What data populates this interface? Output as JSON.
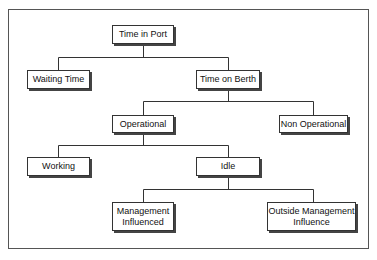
{
  "diagram": {
    "nodes": {
      "time_in_port": "Time in Port",
      "waiting_time": "Waiting Time",
      "time_on_berth": "Time on Berth",
      "operational": "Operational",
      "non_operational": "Non Operational",
      "working": "Working",
      "idle": "Idle",
      "management_influenced_1": "Management",
      "management_influenced_2": "Influenced",
      "outside_management_influence_1": "Outside Management",
      "outside_management_influence_2": "Influence"
    },
    "edges": [
      [
        "Time in Port",
        "Waiting Time"
      ],
      [
        "Time in Port",
        "Time on Berth"
      ],
      [
        "Time on Berth",
        "Operational"
      ],
      [
        "Time on Berth",
        "Non Operational"
      ],
      [
        "Operational",
        "Working"
      ],
      [
        "Operational",
        "Idle"
      ],
      [
        "Idle",
        "Management Influenced"
      ],
      [
        "Idle",
        "Outside Management Influence"
      ]
    ]
  }
}
